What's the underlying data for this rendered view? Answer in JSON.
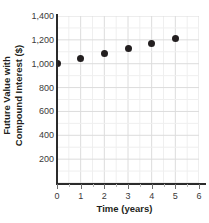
{
  "chart_data": {
    "type": "scatter",
    "title": "",
    "xlabel": "Time (years)",
    "ylabel": "Future Value with Compound Interest ($)",
    "ylabel_line1": "Future Value with",
    "ylabel_line2": "Compound Interest ($)",
    "x": [
      0,
      1,
      2,
      3,
      4,
      5
    ],
    "values": [
      1000,
      1040,
      1085,
      1125,
      1170,
      1215
    ],
    "points": [
      {
        "x": 0,
        "y": 1000
      },
      {
        "x": 1,
        "y": 1040
      },
      {
        "x": 2,
        "y": 1085
      },
      {
        "x": 3,
        "y": 1125
      },
      {
        "x": 4,
        "y": 1170
      },
      {
        "x": 5,
        "y": 1215
      }
    ],
    "xlim": [
      0,
      6
    ],
    "ylim": [
      0,
      1400
    ],
    "x_ticks": [
      0,
      1,
      2,
      3,
      4,
      5,
      6
    ],
    "x_tick_labels": [
      "0",
      "1",
      "2",
      "3",
      "4",
      "5",
      "6"
    ],
    "y_ticks": [
      200,
      400,
      600,
      800,
      1000,
      1200,
      1400
    ],
    "y_tick_labels": [
      "200",
      "400",
      "600",
      "800",
      "1,000",
      "1,200",
      "1,400"
    ],
    "x_minor_per_major": 2,
    "y_minor_per_major": 2,
    "grid": true,
    "legend": false,
    "marker_color": "#231f20",
    "grid_color_major": "#dcdcdc",
    "grid_color_minor": "#efefef",
    "axis_color": "#2b2b2b",
    "background": "#ffffff"
  }
}
